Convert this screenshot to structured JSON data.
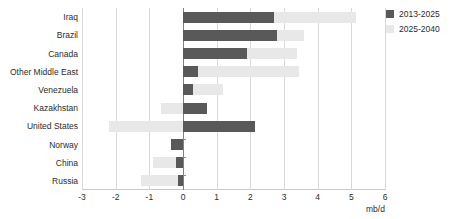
{
  "chart_data": {
    "type": "bar",
    "orientation": "horizontal",
    "stacked": true,
    "title": "",
    "subtitle": "",
    "xlabel": "mb/d",
    "ylabel": "",
    "xlim": [
      -3,
      6
    ],
    "xticks": [
      -3,
      -2,
      -1,
      0,
      1,
      2,
      3,
      4,
      5,
      6
    ],
    "xticklabels": [
      "-3",
      "-2",
      "-1",
      "0",
      "1",
      "2",
      "3",
      "4",
      "5",
      "6"
    ],
    "grid": true,
    "legend_position": "top-right",
    "categories": [
      "Iraq",
      "Brazil",
      "Canada",
      "Other Middle East",
      "Venezuela",
      "Kazakhstan",
      "United States",
      "Norway",
      "China",
      "Russia"
    ],
    "series": [
      {
        "name": "2013-2025",
        "color": "#595959",
        "values": [
          2.7,
          2.8,
          1.9,
          0.45,
          0.3,
          0.7,
          2.15,
          -0.35,
          -0.2,
          -0.15
        ]
      },
      {
        "name": "2025-2040",
        "color": "#e8e8e8",
        "values": [
          2.45,
          0.8,
          1.5,
          3.0,
          0.9,
          -0.65,
          -2.2,
          0.0,
          -0.7,
          -1.1
        ]
      }
    ]
  },
  "legend": {
    "items": [
      {
        "label": "2013-2025",
        "color": "#595959",
        "swatch_name": "legend-swatch-2013-2025"
      },
      {
        "label": "2025-2040",
        "color": "#e8e8e8",
        "swatch_name": "legend-swatch-2025-2040"
      }
    ]
  },
  "axis": {
    "x_title": "mb/d"
  }
}
